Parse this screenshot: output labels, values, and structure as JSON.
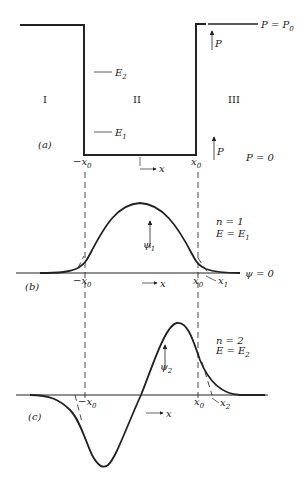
{
  "panel_a": {
    "label": "(a)",
    "regions": [
      "I",
      "II",
      "III"
    ],
    "levels": [
      {
        "name": "E",
        "sub": "2"
      },
      {
        "name": "E",
        "sub": "1"
      }
    ],
    "top_label": "P = P",
    "top_label_sub": "0",
    "bottom_label": "P = 0",
    "arrow_label": "P",
    "left_edge": "−x",
    "right_edge": "x",
    "edge_sub": "0",
    "axis_label": "x"
  },
  "panel_b": {
    "label": "(b)",
    "n_label": "n = 1",
    "e_label": "E = E",
    "e_sub": "1",
    "psi_label": "ψ",
    "psi_sub": "1",
    "zero_label": "ψ = 0",
    "left_edge": "−x",
    "right_edge": "x",
    "edge_sub": "0",
    "turning": "x",
    "turning_sub": "1",
    "axis_label": "x"
  },
  "panel_c": {
    "label": "(c)",
    "n_label": "n = 2",
    "e_label": "E = E",
    "e_sub": "2",
    "psi_label": "ψ",
    "psi_sub": "2",
    "left_edge": "−x",
    "right_edge": "x",
    "edge_sub": "0",
    "turning": "x",
    "turning_sub": "2",
    "axis_label": "x"
  }
}
